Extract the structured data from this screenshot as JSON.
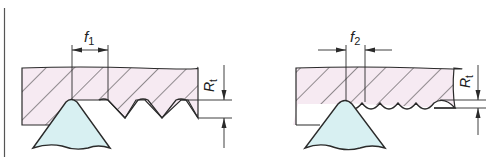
{
  "diagram": {
    "colors": {
      "workpiece_fill": "#f6eaf2",
      "tool_fill": "#d8f0f2",
      "line": "#2a2a2a"
    },
    "panels": [
      {
        "id": "left",
        "feed_label": "f",
        "feed_subscript": "1",
        "roughness_label": "R",
        "roughness_subscript": "t"
      },
      {
        "id": "right",
        "feed_label": "f",
        "feed_subscript": "2",
        "roughness_label": "R",
        "roughness_subscript": "t"
      }
    ]
  }
}
